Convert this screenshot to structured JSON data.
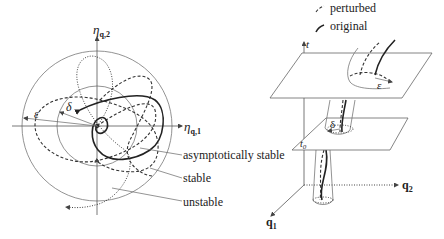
{
  "left_diagram": {
    "axes": {
      "x_label_main": "η",
      "x_label_sub": "q,1",
      "y_label_main": "η",
      "y_label_sub": "q,2"
    },
    "radii": {
      "outer": "ε",
      "inner": "δ"
    },
    "legend": {
      "asymptotically_stable": "asymptotically stable",
      "stable": "stable",
      "unstable": "unstable"
    }
  },
  "right_diagram": {
    "legend": {
      "perturbed": "perturbed",
      "original": "original"
    },
    "axes": {
      "t": "t",
      "q1_main": "q",
      "q1_sub": "1",
      "q2_main": "q",
      "q2_sub": "2"
    },
    "plane_label_main": "t",
    "plane_label_sub": "0",
    "delta": "δ",
    "epsilon": "ε"
  },
  "colors": {
    "ink": "#222222",
    "thin_lines": "#777777",
    "background": "#ffffff"
  }
}
